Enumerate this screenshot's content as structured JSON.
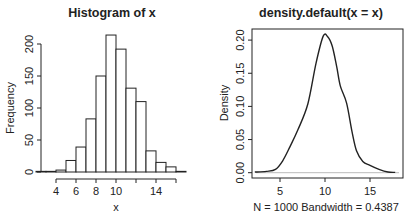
{
  "chart_data": [
    {
      "type": "bar",
      "title": "Histogram of x",
      "xlabel": "x",
      "ylabel": "Frequency",
      "bins": [
        2,
        3,
        4,
        5,
        6,
        7,
        8,
        9,
        10,
        11,
        12,
        13,
        14,
        15,
        16,
        17
      ],
      "categories": [
        "2-3",
        "3-4",
        "4-5",
        "5-6",
        "6-7",
        "7-8",
        "8-9",
        "9-10",
        "10-11",
        "11-12",
        "12-13",
        "13-14",
        "14-15",
        "15-16",
        "16-17"
      ],
      "values": [
        1,
        1,
        3,
        18,
        39,
        83,
        150,
        214,
        192,
        131,
        110,
        33,
        15,
        8,
        1
      ],
      "x_ticks": [
        4,
        6,
        8,
        10,
        12,
        14,
        16
      ],
      "x_tick_labels": [
        "4",
        "6",
        "8",
        "10",
        "",
        "14",
        ""
      ],
      "y_ticks": [
        0,
        50,
        100,
        150,
        200
      ],
      "y_tick_labels": [
        "0",
        "50",
        "100",
        "150",
        "200"
      ],
      "ylim": [
        0,
        220
      ]
    },
    {
      "type": "line",
      "title": "density.default(x = x)",
      "xlabel": "N = 1000   Bandwidth = 0.4387",
      "ylabel": "Density",
      "x": [
        2.2,
        3.5,
        4.5,
        5.3,
        6.1,
        7.0,
        8.1,
        9.0,
        9.8,
        10.3,
        10.8,
        11.3,
        11.7,
        12.4,
        13.0,
        13.5,
        14.2,
        15.0,
        16.0,
        17.0,
        17.8
      ],
      "y": [
        0.001,
        0.002,
        0.005,
        0.018,
        0.039,
        0.065,
        0.104,
        0.165,
        0.206,
        0.205,
        0.191,
        0.16,
        0.131,
        0.105,
        0.062,
        0.033,
        0.017,
        0.011,
        0.005,
        0.001,
        0.0005
      ],
      "x_ticks": [
        5,
        10,
        15
      ],
      "y_ticks": [
        0.0,
        0.05,
        0.1,
        0.15,
        0.2
      ],
      "y_tick_labels": [
        "0.00",
        "0.05",
        "0.10",
        "0.15",
        "0.20"
      ],
      "xlim": [
        1.8,
        18.6
      ],
      "ylim": [
        -0.008,
        0.216
      ]
    }
  ],
  "left": {
    "title": "Histogram of x",
    "xlabel": "x",
    "ylabel": "Frequency"
  },
  "right": {
    "title": "density.default(x = x)",
    "sub": "N = 1000   Bandwidth = 0.4387",
    "ylabel": "Density"
  }
}
